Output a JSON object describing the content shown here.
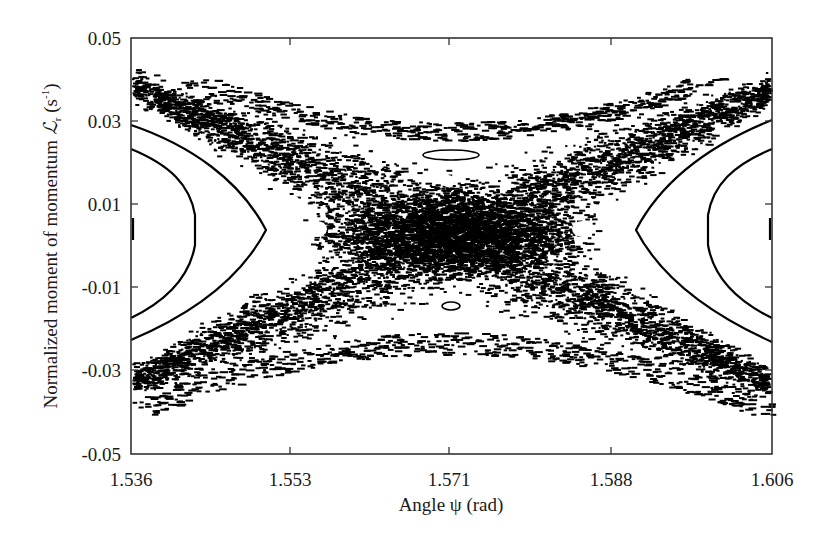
{
  "chart_data": {
    "type": "scatter",
    "title": "",
    "xlabel": "Angle ψ (rad)",
    "ylabel": "Normalized moment of momentum ℒr (s⁻¹)",
    "ylabel_parts": {
      "main": "Normalized moment of momentum ",
      "symbol": "ℒ",
      "subscript": "r",
      "unit_open": " (s",
      "unit_sup": "-1",
      "unit_close": ")"
    },
    "xlim": [
      1.536,
      1.606
    ],
    "ylim": [
      -0.05,
      0.05
    ],
    "xticks": [
      "1.536",
      "1.553",
      "1.571",
      "1.588",
      "1.606"
    ],
    "yticks": [
      "0.05",
      "0.03",
      "0.01",
      "-0.01",
      "-0.03",
      "-0.05"
    ],
    "grid": false,
    "legend": null,
    "marker_color": "#000000",
    "background": "#ffffff",
    "features": {
      "chaotic_band": {
        "center_x": 1.571,
        "center_y": 0.003,
        "left_edge_upper_y": 0.037,
        "left_edge_lower_y": -0.03,
        "right_edge_upper_y": 0.038,
        "right_edge_lower_y": -0.03
      },
      "left_regular_orbits": [
        {
          "vertex_x": 1.5445,
          "vertex_y": 0.003,
          "top_y_at_left": 0.023,
          "bottom_y_at_left": -0.016
        },
        {
          "vertex_x": 1.5505,
          "vertex_y": 0.003,
          "top_y_at_left": 0.028,
          "bottom_y_at_left": -0.022
        }
      ],
      "right_regular_orbits": [
        {
          "vertex_x": 1.5975,
          "vertex_y": 0.003,
          "top_y_at_right": 0.023,
          "bottom_y_at_right": -0.016
        },
        {
          "vertex_x": 1.5915,
          "vertex_y": 0.003,
          "top_y_at_right": 0.028,
          "bottom_y_at_right": -0.022
        }
      ],
      "upper_island": {
        "x": 1.571,
        "y": 0.0165
      },
      "lower_island": {
        "x": 1.571,
        "y": -0.0135
      }
    }
  }
}
